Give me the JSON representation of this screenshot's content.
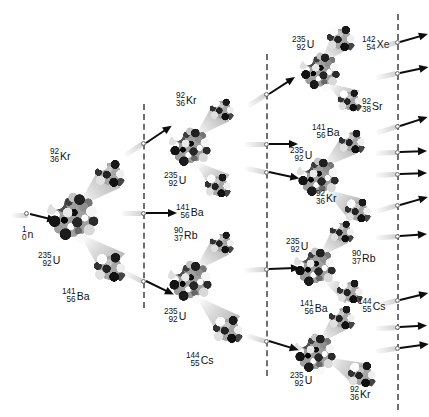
{
  "figure": {
    "background_color": "#ffffff",
    "width": 420,
    "height": 417
  },
  "incident_particle": {
    "mass_number": "1",
    "atomic_number": "0",
    "symbol": "n",
    "x": 18,
    "y": 216
  },
  "dividers": [
    {
      "name": "generation-divider-1",
      "x": 143,
      "y": 104,
      "height": 204
    },
    {
      "name": "generation-divider-2",
      "x": 266,
      "y": 54,
      "height": 322
    },
    {
      "name": "generation-divider-3",
      "x": 397,
      "y": 14,
      "height": 396
    }
  ],
  "generations": [
    {
      "name": "generation-1",
      "nuclei": [
        {
          "id": "u235-g1",
          "target": {
            "mass_number": "235",
            "atomic_number": "92",
            "symbol": "U",
            "cx": 73,
            "cy": 218,
            "r": 27,
            "label_x": 38,
            "label_y": 252
          },
          "fragments": [
            {
              "mass_number": "92",
              "atomic_number": "36",
              "symbol": "Kr",
              "cx": 110,
              "cy": 174,
              "r": 16,
              "label_x": 50,
              "label_y": 148,
              "cone_x": 80,
              "cone_y": 205,
              "cone_len": 42,
              "cone_w": 30,
              "cone_rot": -43
            },
            {
              "mass_number": "141",
              "atomic_number": "56",
              "symbol": "Ba",
              "cx": 110,
              "cy": 268,
              "r": 17,
              "label_x": 62,
              "label_y": 288,
              "cone_x": 82,
              "cone_y": 236,
              "cone_len": 44,
              "cone_w": 32,
              "cone_rot": 42
            }
          ]
        }
      ]
    },
    {
      "name": "generation-2",
      "nuclei": [
        {
          "id": "u235-g2-a",
          "target": {
            "mass_number": "235",
            "atomic_number": "92",
            "symbol": "U",
            "cx": 190,
            "cy": 148,
            "r": 22,
            "label_x": 164,
            "label_y": 172
          },
          "fragments": [
            {
              "mass_number": "92",
              "atomic_number": "36",
              "symbol": "Kr",
              "cx": 222,
              "cy": 110,
              "r": 13,
              "label_x": 176,
              "label_y": 92,
              "cone_x": 196,
              "cone_y": 136,
              "cone_len": 35,
              "cone_w": 24,
              "cone_rot": -43
            },
            {
              "mass_number": "141",
              "atomic_number": "56",
              "symbol": "Ba",
              "cx": 218,
              "cy": 186,
              "r": 14,
              "label_x": 176,
              "label_y": 204,
              "cone_x": 196,
              "cone_y": 162,
              "cone_len": 34,
              "cone_w": 25,
              "cone_rot": 40
            }
          ]
        },
        {
          "id": "u235-g2-b",
          "target": {
            "mass_number": "235",
            "atomic_number": "92",
            "symbol": "U",
            "cx": 190,
            "cy": 282,
            "r": 23,
            "label_x": 164,
            "label_y": 308
          },
          "fragments": [
            {
              "mass_number": "90",
              "atomic_number": "37",
              "symbol": "Rb",
              "cx": 222,
              "cy": 243,
              "r": 13,
              "label_x": 174,
              "label_y": 227,
              "cone_x": 196,
              "cone_y": 270,
              "cone_len": 35,
              "cone_w": 24,
              "cone_rot": -44
            },
            {
              "mass_number": "144",
              "atomic_number": "55",
              "symbol": "Cs",
              "cx": 228,
              "cy": 330,
              "r": 16,
              "label_x": 186,
              "label_y": 352,
              "cone_x": 198,
              "cone_y": 298,
              "cone_len": 44,
              "cone_w": 30,
              "cone_rot": 42
            }
          ]
        }
      ]
    },
    {
      "name": "generation-3",
      "nuclei": [
        {
          "id": "u235-g3-a",
          "target": {
            "mass_number": "235",
            "atomic_number": "92",
            "symbol": "U",
            "cx": 320,
            "cy": 72,
            "r": 21,
            "label_x": 292,
            "label_y": 36
          },
          "fragments": [
            {
              "mass_number": "142",
              "atomic_number": "54",
              "symbol": "Xe",
              "cx": 341,
              "cy": 39,
              "r": 15,
              "label_x": 362,
              "label_y": 36,
              "cone_x": 322,
              "cone_y": 62,
              "cone_len": 30,
              "cone_w": 24,
              "cone_rot": -48
            },
            {
              "mass_number": "92",
              "atomic_number": "38",
              "symbol": "Sr",
              "cx": 350,
              "cy": 101,
              "r": 13,
              "label_x": 362,
              "label_y": 98,
              "cone_x": 328,
              "cone_y": 84,
              "cone_len": 30,
              "cone_w": 22,
              "cone_rot": 32
            }
          ]
        },
        {
          "id": "u235-g3-b",
          "target": {
            "mass_number": "235",
            "atomic_number": "92",
            "symbol": "U",
            "cx": 318,
            "cy": 178,
            "r": 22,
            "label_x": 290,
            "label_y": 147
          },
          "fragments": [
            {
              "mass_number": "141",
              "atomic_number": "56",
              "symbol": "Ba",
              "cx": 352,
              "cy": 142,
              "r": 14,
              "label_x": 312,
              "label_y": 124,
              "cone_x": 324,
              "cone_y": 166,
              "cone_len": 34,
              "cone_w": 24,
              "cone_rot": -40
            },
            {
              "mass_number": "92",
              "atomic_number": "36",
              "symbol": "Kr",
              "cx": 358,
              "cy": 211,
              "r": 14,
              "label_x": 316,
              "label_y": 190,
              "cone_x": 326,
              "cone_y": 190,
              "cone_len": 34,
              "cone_w": 24,
              "cone_rot": 33
            }
          ]
        },
        {
          "id": "u235-g3-c",
          "target": {
            "mass_number": "235",
            "atomic_number": "92",
            "symbol": "U",
            "cx": 315,
            "cy": 268,
            "r": 22,
            "label_x": 286,
            "label_y": 238
          },
          "fragments": [
            {
              "mass_number": "90",
              "atomic_number": "37",
              "symbol": "Rb",
              "cx": 342,
              "cy": 232,
              "r": 13,
              "label_x": 352,
              "label_y": 250,
              "cone_x": 320,
              "cone_y": 256,
              "cone_len": 30,
              "cone_w": 22,
              "cone_rot": -45
            },
            {
              "mass_number": "144",
              "atomic_number": "55",
              "symbol": "Cs",
              "cx": 350,
              "cy": 292,
              "r": 14,
              "label_x": 358,
              "label_y": 298,
              "cone_x": 324,
              "cone_y": 280,
              "cone_len": 30,
              "cone_w": 22,
              "cone_rot": 28
            }
          ]
        },
        {
          "id": "u235-g3-d",
          "target": {
            "mass_number": "235",
            "atomic_number": "92",
            "symbol": "U",
            "cx": 315,
            "cy": 354,
            "r": 22,
            "label_x": 290,
            "label_y": 372
          },
          "fragments": [
            {
              "mass_number": "141",
              "atomic_number": "56",
              "symbol": "Ba",
              "cx": 342,
              "cy": 318,
              "r": 14,
              "label_x": 300,
              "label_y": 300,
              "cone_x": 320,
              "cone_y": 342,
              "cone_len": 30,
              "cone_w": 22,
              "cone_rot": -45
            },
            {
              "mass_number": "92",
              "atomic_number": "36",
              "symbol": "Kr",
              "cx": 362,
              "cy": 375,
              "r": 15,
              "label_x": 350,
              "label_y": 386,
              "cone_x": 326,
              "cone_y": 358,
              "cone_len": 36,
              "cone_w": 24,
              "cone_rot": 26
            }
          ]
        }
      ]
    }
  ],
  "neutron_arrows": {
    "into_generation_2": [
      {
        "x": 143,
        "y": 143,
        "rot": -34,
        "len": 26
      },
      {
        "x": 143,
        "y": 213,
        "rot": 0,
        "len": 26
      },
      {
        "x": 143,
        "y": 281,
        "rot": 26,
        "len": 26
      }
    ],
    "into_generation_3": [
      {
        "x": 266,
        "y": 94,
        "rot": -33,
        "len": 26
      },
      {
        "x": 266,
        "y": 144,
        "rot": 0,
        "len": 24
      },
      {
        "x": 266,
        "y": 172,
        "rot": 12,
        "len": 26
      },
      {
        "x": 266,
        "y": 269,
        "rot": -2,
        "len": 26
      },
      {
        "x": 266,
        "y": 341,
        "rot": 17,
        "len": 26
      }
    ],
    "escaping": [
      {
        "x": 397,
        "y": 42,
        "rot": -16,
        "len": 24
      },
      {
        "x": 397,
        "y": 73,
        "rot": -12,
        "len": 24
      },
      {
        "x": 397,
        "y": 126,
        "rot": -18,
        "len": 24
      },
      {
        "x": 397,
        "y": 152,
        "rot": -2,
        "len": 22
      },
      {
        "x": 397,
        "y": 174,
        "rot": -2,
        "len": 22
      },
      {
        "x": 397,
        "y": 205,
        "rot": -16,
        "len": 24
      },
      {
        "x": 397,
        "y": 236,
        "rot": -4,
        "len": 22
      },
      {
        "x": 397,
        "y": 300,
        "rot": -14,
        "len": 24
      },
      {
        "x": 397,
        "y": 327,
        "rot": -3,
        "len": 22
      },
      {
        "x": 397,
        "y": 348,
        "rot": -8,
        "len": 24
      }
    ]
  }
}
